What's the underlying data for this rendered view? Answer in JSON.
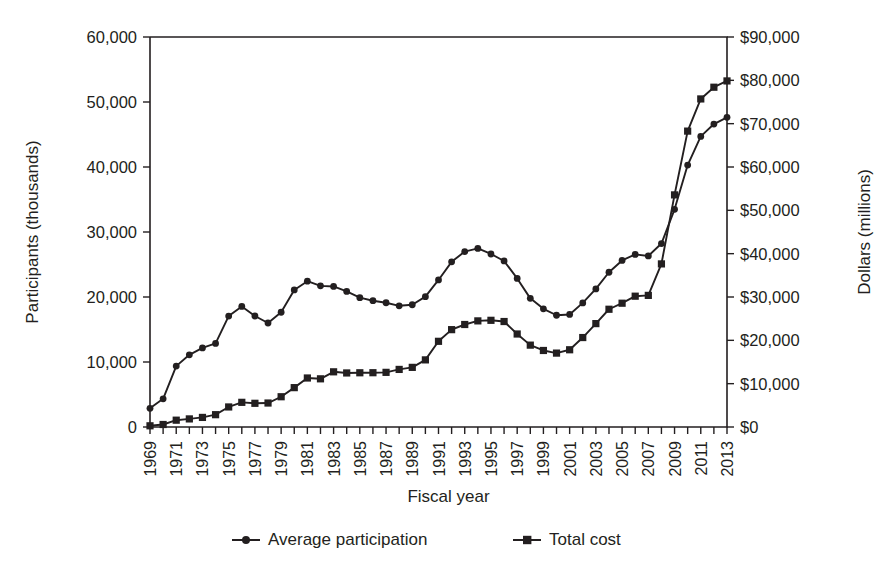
{
  "chart_data": {
    "type": "line",
    "title": "",
    "xlabel": "Fiscal year",
    "ylabel": "Participants (thousands)",
    "y2label": "Dollars (millions)",
    "grid": false,
    "legend_position": "bottom",
    "xlim": [
      1969,
      2013
    ],
    "ylim": [
      0,
      60000
    ],
    "y2lim": [
      0,
      90000
    ],
    "ytick_labels": [
      "0",
      "10,000",
      "20,000",
      "30,000",
      "40,000",
      "50,000",
      "60,000"
    ],
    "ytick_values": [
      0,
      10000,
      20000,
      30000,
      40000,
      50000,
      60000
    ],
    "y2tick_labels": [
      "$0",
      "$10,000",
      "$20,000",
      "$30,000",
      "$40,000",
      "$50,000",
      "$60,000",
      "$70,000",
      "$80,000",
      "$90,000"
    ],
    "y2tick_values": [
      0,
      10000,
      20000,
      30000,
      40000,
      50000,
      60000,
      70000,
      80000,
      90000
    ],
    "x": [
      1969,
      1970,
      1971,
      1972,
      1973,
      1974,
      1975,
      1976,
      1977,
      1978,
      1979,
      1980,
      1981,
      1982,
      1983,
      1984,
      1985,
      1986,
      1987,
      1988,
      1989,
      1990,
      1991,
      1992,
      1993,
      1994,
      1995,
      1996,
      1997,
      1998,
      1999,
      2000,
      2001,
      2002,
      2003,
      2004,
      2005,
      2006,
      2007,
      2008,
      2009,
      2010,
      2011,
      2012,
      2013
    ],
    "xtick_labels": [
      "1969",
      "1971",
      "1973",
      "1975",
      "1977",
      "1979",
      "1981",
      "1983",
      "1985",
      "1987",
      "1989",
      "1991",
      "1993",
      "1995",
      "1997",
      "1999",
      "2001",
      "2003",
      "2005",
      "2007",
      "2009",
      "2011",
      "2013"
    ],
    "xtick_values": [
      1969,
      1971,
      1973,
      1975,
      1977,
      1979,
      1981,
      1983,
      1985,
      1987,
      1989,
      1991,
      1993,
      1995,
      1997,
      1999,
      2001,
      2003,
      2005,
      2007,
      2009,
      2011,
      2013
    ],
    "series": [
      {
        "name": "Average participation",
        "axis": "left",
        "marker": "circle",
        "values": [
          2878,
          4340,
          9368,
          11109,
          12166,
          12862,
          17064,
          18549,
          17077,
          16001,
          17653,
          21082,
          22430,
          21717,
          21625,
          20854,
          19899,
          19429,
          19113,
          18645,
          18806,
          20049,
          22625,
          25407,
          26987,
          27474,
          26619,
          25543,
          22858,
          19791,
          18183,
          17194,
          17318,
          19096,
          21250,
          23811,
          25628,
          26549,
          26316,
          28223,
          33490,
          40302,
          44709,
          46609,
          47636
        ]
      },
      {
        "name": "Total cost",
        "axis": "right",
        "marker": "square",
        "values": [
          278,
          577,
          1573,
          1866,
          2211,
          2844,
          4624,
          5692,
          5469,
          5533,
          6984,
          9083,
          11308,
          11118,
          12733,
          12472,
          12515,
          12529,
          12611,
          13288,
          13762,
          15490,
          19774,
          22466,
          23653,
          24490,
          24620,
          24342,
          21462,
          18891,
          17659,
          17054,
          17825,
          20645,
          23860,
          27174,
          28568,
          30187,
          30373,
          37639,
          53563,
          68283,
          75706,
          78411,
          79859
        ]
      }
    ],
    "axis_geometry": {
      "plot_left": 150,
      "plot_right": 727,
      "plot_top": 37,
      "plot_bottom": 427
    }
  },
  "legend": {
    "items": [
      {
        "label": "Average participation",
        "marker": "circle"
      },
      {
        "label": "Total cost",
        "marker": "square"
      }
    ]
  }
}
